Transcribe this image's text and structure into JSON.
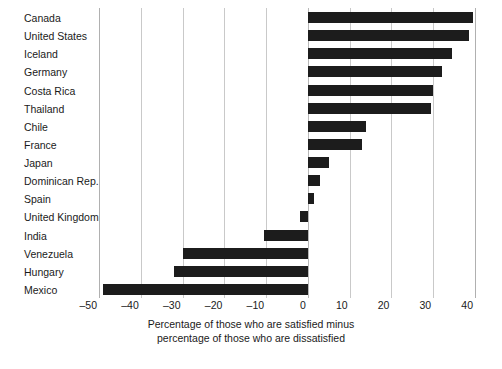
{
  "chart_data": {
    "type": "bar",
    "orientation": "horizontal",
    "title": "",
    "subtitle": "",
    "xlabel": "Percentage of those who are satisfied minus percentage of those who are dissatisfied",
    "ylabel": "",
    "xlim": [
      -50,
      40
    ],
    "ylim": null,
    "grid": "vertical",
    "legend": null,
    "annotations": [],
    "bar_color": "#1c1c1c",
    "background_color": "#ffffff",
    "gridline_color": "#c9c9c9",
    "xticks": [
      -50,
      -40,
      -30,
      -20,
      -10,
      0,
      10,
      20,
      30,
      40
    ],
    "xtick_labels": [
      "–50",
      "–40",
      "–30",
      "–20",
      "–10",
      "0",
      "10",
      "20",
      "30",
      "40"
    ],
    "categories": [
      "Canada",
      "United States",
      "Iceland",
      "Germany",
      "Costa Rica",
      "Thailand",
      "Chile",
      "France",
      "Japan",
      "Dominican Rep.",
      "Spain",
      "United Kingdom",
      "India",
      "Venezuela",
      "Hungary",
      "Mexico"
    ],
    "values": [
      39.5,
      38.5,
      34.5,
      32,
      30,
      29.5,
      14,
      13,
      5,
      3,
      1.5,
      -2,
      -10.5,
      -30,
      -32,
      -49
    ]
  },
  "caption": {
    "line1": "Percentage of those who are satisfied minus",
    "line2": "percentage of those who are dissatisfied"
  }
}
